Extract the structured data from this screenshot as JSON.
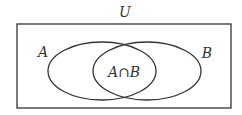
{
  "diagram": {
    "type": "venn",
    "universe": {
      "label": "U",
      "rect": {
        "x": 17,
        "y": 24,
        "width": 214,
        "height": 84
      }
    },
    "sets": [
      {
        "label": "A",
        "ellipse": {
          "cx": 102,
          "cy": 71,
          "rx": 54,
          "ry": 29
        },
        "label_pos": {
          "x": 43,
          "y": 57
        }
      },
      {
        "label": "B",
        "ellipse": {
          "cx": 147,
          "cy": 71,
          "rx": 54,
          "ry": 29
        },
        "label_pos": {
          "x": 207,
          "y": 58
        }
      }
    ],
    "intersection": {
      "label": "A∩B",
      "label_pos": {
        "x": 124,
        "y": 77
      }
    },
    "colors": {
      "stroke": "#333333",
      "background": "#ffffff"
    }
  }
}
